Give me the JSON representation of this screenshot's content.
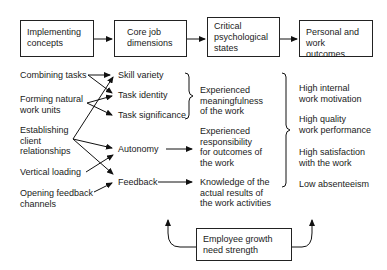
{
  "header_boxes": [
    {
      "label": "Implementing\nconcepts"
    },
    {
      "label": "Core job\ndimensions"
    },
    {
      "label": "Critical\npsychological\nstates"
    },
    {
      "label": "Personal and\nwork outcomes"
    }
  ],
  "implementing_concepts": [
    "Combining tasks",
    "Forming natural\nwork units",
    "Establishing\nclient\nrelationships",
    "Vertical loading",
    "Opening feedback\nchannels"
  ],
  "core_dimensions": [
    "Skill variety",
    "Task identity",
    "Task significance",
    "Autonomy",
    "Feedback"
  ],
  "psychological_states": [
    "Experienced\nmeaningfulness\nof the work",
    "Experienced\nresponsibility\nfor outcomes of\nthe work",
    "Knowledge of the\nactual results of\nthe work activities"
  ],
  "outcomes": [
    "High internal\nwork motivation",
    "High quality\nwork performance",
    "High satisfaction\nwith the work",
    "Low absenteeism"
  ],
  "moderator": {
    "label": "Employee growth\nneed strength"
  }
}
